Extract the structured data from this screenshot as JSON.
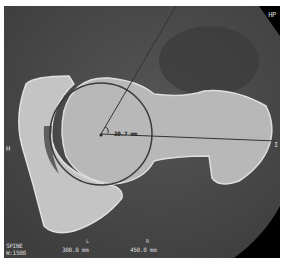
{
  "image": {
    "type": "CT scan (axial)",
    "colors": {
      "background": "#4a4a4a",
      "bone": "#c8c8c8",
      "corner": "#000000",
      "line": "#333333"
    }
  },
  "labels": {
    "top_right": "HP",
    "left": "H",
    "right": "I",
    "measurement": "30.7 mm",
    "bottom_left_1": "SPINE",
    "bottom_left_2": "W:1500",
    "bottom_mid_marker": "L",
    "bottom_mid": "300.0 mm",
    "bottom_right_marker": "R",
    "bottom_right": "450.0 mm"
  }
}
